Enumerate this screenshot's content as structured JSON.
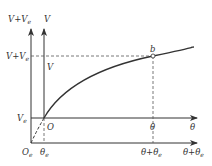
{
  "diagram": {
    "colors": {
      "line": "#333333",
      "dashed": "#555555",
      "background": "#ffffff"
    },
    "axes": {
      "outer_vertical_label": "V+V",
      "outer_vertical_label_sub": "e",
      "inner_vertical_label": "V",
      "inner_horizontal_label": "θ",
      "outer_horizontal_label": "θ+θ",
      "outer_horizontal_label_sub": "e"
    },
    "origins": {
      "inner_origin": "O",
      "outer_origin": "O",
      "outer_origin_sub": "e"
    },
    "ticks": {
      "vertical_ve_label": "V",
      "vertical_ve_sub": "e",
      "vertical_top_outer": "V+V",
      "vertical_top_outer_sub": "e",
      "vertical_top_inner": "V",
      "horizontal_theta_e": "θ",
      "horizontal_theta_e_sub": "e",
      "horizontal_theta": "θ",
      "horizontal_theta_plus": "θ+θ",
      "horizontal_theta_plus_sub": "e"
    },
    "point": {
      "label": "b"
    }
  }
}
